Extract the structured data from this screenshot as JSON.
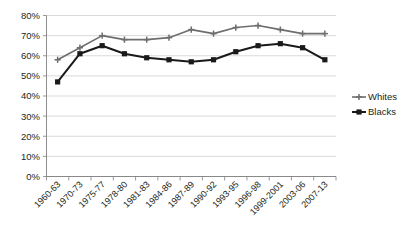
{
  "chart_data": {
    "type": "line",
    "title": "",
    "xlabel": "",
    "ylabel": "",
    "ylim": [
      0,
      80
    ],
    "ytick_step": 10,
    "grid": true,
    "legend_position": "right",
    "categories": [
      "1960-63",
      "1970-73",
      "1975-77",
      "1978-80",
      "1981-83",
      "1984-86",
      "1987-89",
      "1990-92",
      "1993-95",
      "1996-98",
      "1999-2001",
      "2003-06",
      "2007-13"
    ],
    "ytick_labels": [
      "80%",
      "70%",
      "60%",
      "50%",
      "40%",
      "30%",
      "20%",
      "10%",
      "0%"
    ],
    "ytick_values": [
      80,
      70,
      60,
      50,
      40,
      30,
      20,
      10,
      0
    ],
    "series": [
      {
        "name": "Whites",
        "color": "#6e6e6e",
        "marker": "plus",
        "values": [
          58,
          64,
          70,
          68,
          68,
          69,
          73,
          71,
          74,
          75,
          73,
          71,
          71
        ]
      },
      {
        "name": "Blacks",
        "color": "#1a1a1a",
        "marker": "square",
        "values": [
          47,
          61,
          65,
          61,
          59,
          58,
          57,
          58,
          62,
          65,
          66,
          64,
          58
        ]
      }
    ]
  },
  "legend": {
    "items": [
      {
        "label": "Whites"
      },
      {
        "label": "Blacks"
      }
    ]
  },
  "colors": {
    "whites": "#6e6e6e",
    "blacks": "#1a1a1a",
    "grid": "#c8c8c8",
    "axis": "#808080",
    "background": "#ffffff",
    "text": "#231f20"
  }
}
